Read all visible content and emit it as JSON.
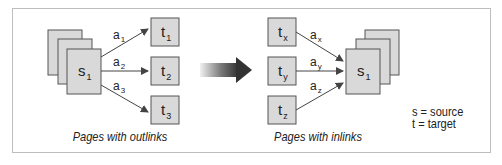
{
  "diagram": {
    "left_panel": {
      "source_label": "s",
      "source_sub": "1",
      "targets": [
        {
          "label": "t",
          "sub": "1",
          "link_label": "a",
          "link_sub": "1"
        },
        {
          "label": "t",
          "sub": "2",
          "link_label": "a",
          "link_sub": "2"
        },
        {
          "label": "t",
          "sub": "3",
          "link_label": "a",
          "link_sub": "3"
        }
      ],
      "caption": "Pages with outlinks"
    },
    "right_panel": {
      "source_label": "s",
      "source_sub": "1",
      "targets": [
        {
          "label": "t",
          "sub": "x",
          "link_label": "a",
          "link_sub": "x"
        },
        {
          "label": "t",
          "sub": "y",
          "link_label": "a",
          "link_sub": "y"
        },
        {
          "label": "t",
          "sub": "z",
          "link_label": "a",
          "link_sub": "z"
        }
      ],
      "caption": "Pages with inlinks"
    },
    "legend": {
      "line1": "s = source",
      "line2": "t = target"
    },
    "colors": {
      "box_fill": "#d9d9d9",
      "box_stroke": "#555555",
      "arrow": "#444444",
      "transition_arrow_dark": "#3a3a3a",
      "transition_arrow_light": "#e6e6e6",
      "frame": "#bdbdbd"
    }
  }
}
